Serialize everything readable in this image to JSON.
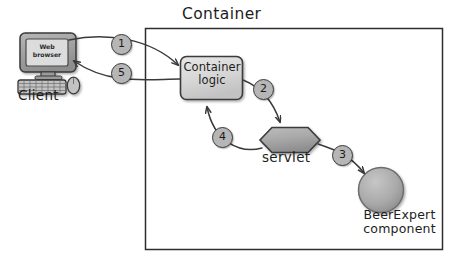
{
  "diagram": {
    "title": "Container",
    "type": "request-flow",
    "container_box": {
      "x": 145,
      "y": 28,
      "width": 298,
      "height": 222
    },
    "nodes": [
      {
        "id": "client",
        "label": "Client",
        "icon": "desktop-computer-icon",
        "screen_text_line1": "Web",
        "screen_text_line2": "browser",
        "shape": "computer",
        "inside_container": false
      },
      {
        "id": "container-logic",
        "label_line1": "Container",
        "label_line2": "logic",
        "shape": "rounded-rectangle",
        "inside_container": true
      },
      {
        "id": "servlet",
        "label": "servlet",
        "shape": "hexagon",
        "inside_container": true
      },
      {
        "id": "beerexpert",
        "label_line1": "BeerExpert",
        "label_line2": "component",
        "shape": "circle",
        "inside_container": true
      }
    ],
    "steps": [
      {
        "number": "1",
        "from": "client",
        "to": "container-logic"
      },
      {
        "number": "2",
        "from": "container-logic",
        "to": "servlet"
      },
      {
        "number": "3",
        "from": "servlet",
        "to": "beerexpert"
      },
      {
        "number": "4",
        "from": "servlet",
        "to": "container-logic"
      },
      {
        "number": "5",
        "from": "container-logic",
        "to": "client"
      }
    ],
    "colors": {
      "background": "#ffffff",
      "stroke": "#3a3a3a",
      "shape_fill": "#d6d6d6",
      "shape_fill_dark": "#a8a8a8",
      "badge_fill": "#b6b6b6",
      "text": "#1d1d1d",
      "container_border": "#2d2d2d"
    }
  }
}
